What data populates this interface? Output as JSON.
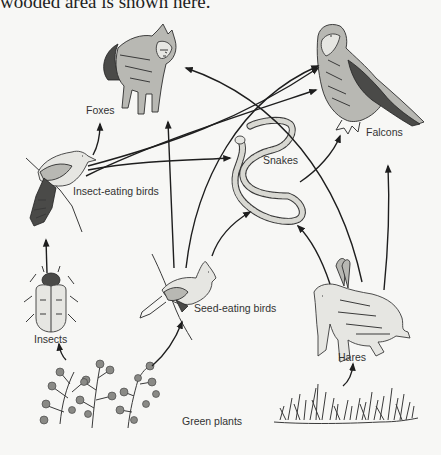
{
  "caption": "wooded area is shown here.",
  "organisms": {
    "foxes": {
      "label": "Foxes",
      "icon": "fox-illustration"
    },
    "falcons": {
      "label": "Falcons",
      "icon": "falcon-illustration"
    },
    "snakes": {
      "label": "Snakes",
      "icon": "snake-illustration"
    },
    "insect_eating_birds": {
      "label": "Insect-eating birds",
      "icon": "insect-eating-bird-illustration"
    },
    "seed_eating_birds": {
      "label": "Seed-eating birds",
      "icon": "seed-eating-bird-illustration"
    },
    "insects": {
      "label": "Insects",
      "icon": "beetle-illustration"
    },
    "hares": {
      "label": "Hares",
      "icon": "hare-illustration"
    },
    "green_plants": {
      "label": "Green plants",
      "icon": "plants-and-grass-illustration"
    }
  },
  "food_web_arrows": [
    {
      "from": "Green plants",
      "to": "Insects"
    },
    {
      "from": "Green plants",
      "to": "Seed-eating birds"
    },
    {
      "from": "Green plants",
      "to": "Hares"
    },
    {
      "from": "Insects",
      "to": "Insect-eating birds"
    },
    {
      "from": "Insect-eating birds",
      "to": "Foxes"
    },
    {
      "from": "Insect-eating birds",
      "to": "Snakes"
    },
    {
      "from": "Insect-eating birds",
      "to": "Falcons"
    },
    {
      "from": "Seed-eating birds",
      "to": "Foxes"
    },
    {
      "from": "Seed-eating birds",
      "to": "Falcons"
    },
    {
      "from": "Seed-eating birds",
      "to": "Snakes"
    },
    {
      "from": "Snakes",
      "to": "Falcons"
    },
    {
      "from": "Hares",
      "to": "Foxes"
    },
    {
      "from": "Hares",
      "to": "Snakes"
    },
    {
      "from": "Hares",
      "to": "Falcons"
    }
  ],
  "colors": {
    "background": "#f7f7f5",
    "ink": "#1e1e1e"
  }
}
